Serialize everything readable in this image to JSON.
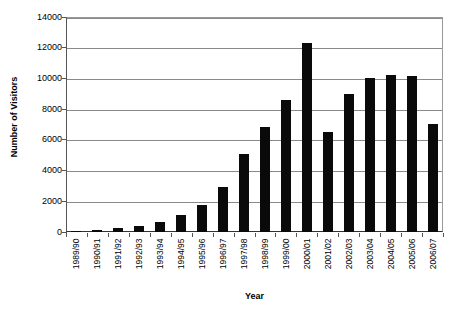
{
  "chart_data": {
    "type": "bar",
    "title": "",
    "xlabel": "Year",
    "ylabel": "Number of Visitors",
    "ylim": [
      0,
      14000
    ],
    "ytick_step": 2000,
    "yticks": [
      14000,
      12000,
      10000,
      8000,
      6000,
      4000,
      2000,
      0
    ],
    "ytick_labels": [
      "14000",
      "12000",
      "10000",
      "8000",
      "6000",
      "4000",
      "2000",
      "0"
    ],
    "grid": true,
    "legend": false,
    "legend_position": "none",
    "bar_color": "#0a0a0a",
    "categories": [
      "1989/90",
      "1990/91",
      "1991/92",
      "1992/93",
      "1993/94",
      "1994/95",
      "1995/96",
      "1996/97",
      "1997/98",
      "1998/99",
      "1999/00",
      "2000/01",
      "2001/02",
      "2002/03",
      "2003/04",
      "2004/05",
      "2005/06",
      "2006/07"
    ],
    "values": [
      70,
      110,
      250,
      390,
      620,
      1120,
      1760,
      2900,
      5100,
      6850,
      8600,
      12300,
      6520,
      9000,
      10020,
      10220,
      10160,
      7020
    ]
  },
  "axis": {
    "y_title": "Number of Visitors",
    "x_title": "Year"
  },
  "title_sliver": {
    "text": ""
  }
}
